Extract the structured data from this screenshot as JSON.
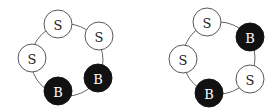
{
  "diagrams": [
    {
      "name": "left-ring",
      "ring": {
        "cx": 67,
        "cy": 60,
        "r": 36
      },
      "nodes": [
        {
          "label": "S",
          "type": "S",
          "cx": 58,
          "cy": 24
        },
        {
          "label": "S",
          "type": "S",
          "cx": 99,
          "cy": 36
        },
        {
          "label": "S",
          "type": "S",
          "cx": 32,
          "cy": 58
        },
        {
          "label": "B",
          "type": "B",
          "cx": 98,
          "cy": 78
        },
        {
          "label": "B",
          "type": "B",
          "cx": 58,
          "cy": 91
        }
      ]
    },
    {
      "name": "right-ring",
      "ring": {
        "cx": 219,
        "cy": 58,
        "r": 36
      },
      "nodes": [
        {
          "label": "S",
          "type": "S",
          "cx": 207,
          "cy": 22
        },
        {
          "label": "B",
          "type": "B",
          "cx": 250,
          "cy": 37
        },
        {
          "label": "S",
          "type": "S",
          "cx": 183,
          "cy": 59
        },
        {
          "label": "S",
          "type": "S",
          "cx": 250,
          "cy": 79
        },
        {
          "label": "B",
          "type": "B",
          "cx": 209,
          "cy": 93
        }
      ]
    }
  ],
  "node_radius": 14,
  "colors": {
    "S_fill": "#ffffff",
    "B_fill": "#111111",
    "stroke": "#444444"
  }
}
